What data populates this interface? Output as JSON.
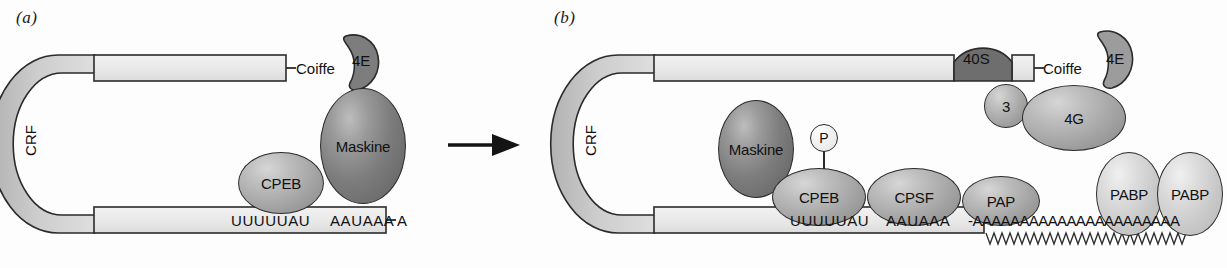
{
  "figure": {
    "type": "diagram",
    "panels": [
      {
        "id": "a",
        "label": "(a)",
        "state": "masked / repressed mRNA",
        "mrna": {
          "cap_label": "Coiffe",
          "left_arm_label": "CRF",
          "sequence_elements": [
            {
              "name": "CPE",
              "text": "UUUUUAU"
            },
            {
              "name": "hexanucleotide",
              "text": "AAUAAA"
            }
          ],
          "poly_a_tail": "A",
          "poly_a_count": 1
        },
        "proteins": [
          {
            "name": "4E",
            "label": "4E",
            "shade": "dark",
            "shape": "crescent"
          },
          {
            "name": "Maskine",
            "label": "Maskine",
            "shade": "dark",
            "shape": "ellipse"
          },
          {
            "name": "CPEB",
            "label": "CPEB",
            "shade": "mid",
            "shape": "ellipse"
          }
        ]
      },
      {
        "id": "b",
        "label": "(b)",
        "state": "activated / polyadenylated mRNA",
        "mrna": {
          "cap_label": "Coiffe",
          "left_arm_label": "CRF",
          "sequence_elements": [
            {
              "name": "CPE",
              "text": "UUUUUAU"
            },
            {
              "name": "hexanucleotide",
              "text": "AAUAAA"
            }
          ],
          "poly_a_tail": "-AAAAAAAAAAAAAAAAAAAAAA",
          "poly_a_count": 22
        },
        "proteins": [
          {
            "name": "40S",
            "label": "40S",
            "shade": "dark",
            "shape": "dome"
          },
          {
            "name": "eIF3",
            "label": "3",
            "shade": "mid",
            "shape": "circle"
          },
          {
            "name": "4E",
            "label": "4E",
            "shade": "mid",
            "shape": "crescent"
          },
          {
            "name": "4G",
            "label": "4G",
            "shade": "mid",
            "shape": "ellipse"
          },
          {
            "name": "Maskine",
            "label": "Maskine",
            "shade": "dark",
            "shape": "ellipse"
          },
          {
            "name": "CPEB",
            "label": "CPEB",
            "shade": "mid",
            "shape": "ellipse"
          },
          {
            "name": "CPSF",
            "label": "CPSF",
            "shade": "mid",
            "shape": "ellipse"
          },
          {
            "name": "PAP",
            "label": "PAP",
            "shade": "mid",
            "shape": "ellipse"
          },
          {
            "name": "PABP-1",
            "label": "PABP",
            "shade": "light",
            "shape": "ellipse"
          },
          {
            "name": "PABP-2",
            "label": "PABP",
            "shade": "light",
            "shape": "ellipse"
          }
        ],
        "phosphate": {
          "label": "P"
        }
      }
    ],
    "transition_arrow": {
      "direction": "right"
    },
    "colors": {
      "outline": "#2b2b2b",
      "mrna_fill_light": "#ebebeb",
      "mrna_fill_arm": "#c9c9c9",
      "protein_dark": "#6d6d6d",
      "protein_mid": "#a6a6a6",
      "protein_light": "#cfcfcf",
      "background": "#fdfdfd"
    }
  }
}
